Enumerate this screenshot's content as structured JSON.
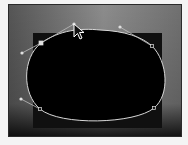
{
  "canvas": {
    "width": 188,
    "height": 145,
    "background": "#f4f4f4"
  },
  "frame": {
    "x": 8,
    "y": 4,
    "width": 174,
    "height": 133,
    "border_color": "#2a2a2a",
    "gradient": [
      "#5a5a5a",
      "#8a8a8a",
      "#6e6e6e"
    ]
  },
  "backdrop_rect": {
    "x": 33,
    "y": 33,
    "width": 129,
    "height": 95,
    "color": "#101010"
  },
  "mask": {
    "shape": "ellipse",
    "fill": "#000000",
    "stroke": "#d8d8d8",
    "path": "M 41 43 C 60 30, 80 28, 100 30 C 125 31, 142 37, 152 46 C 168 62, 170 95, 154 108 C 135 124, 60 126, 40 109 C 22 94, 22 58, 41 43 Z"
  },
  "anchors": [
    {
      "name": "anchor-top-left",
      "x": 41,
      "y": 43,
      "selected": true
    },
    {
      "name": "anchor-top-right",
      "x": 152,
      "y": 46,
      "selected": false
    },
    {
      "name": "anchor-bottom-left",
      "x": 40,
      "y": 109,
      "selected": false
    },
    {
      "name": "anchor-bottom-right",
      "x": 154,
      "y": 108,
      "selected": false
    }
  ],
  "handles": [
    {
      "name": "handle-top-left-in",
      "x1": 41,
      "y1": 43,
      "x2": 22,
      "y2": 53
    },
    {
      "name": "handle-top-left-out",
      "x1": 41,
      "y1": 43,
      "x2": 74,
      "y2": 24
    },
    {
      "name": "handle-top-right-in",
      "x1": 152,
      "y1": 46,
      "x2": 120,
      "y2": 27
    },
    {
      "name": "handle-bottom-left-in",
      "x1": 40,
      "y1": 109,
      "x2": 21,
      "y2": 99
    }
  ],
  "cursor": {
    "type": "arrow",
    "x": 74,
    "y": 24
  },
  "colors": {
    "path_stroke": "#d8d8d8",
    "handle_line": "#bdbdbd",
    "anchor_fill": "#e0e0e0",
    "cursor_fill": "#111111",
    "cursor_stroke": "#ffffff"
  }
}
